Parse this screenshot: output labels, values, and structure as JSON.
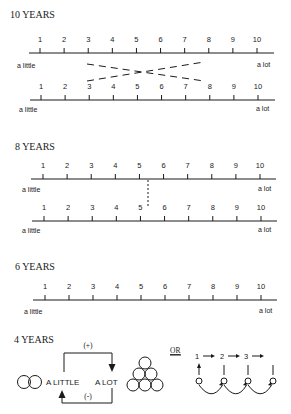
{
  "scale": {
    "numbers": [
      "1",
      "2",
      "3",
      "4",
      "5",
      "6",
      "7",
      "8",
      "9",
      "10"
    ],
    "low_label": "a little",
    "high_label": "a lot"
  },
  "sections": [
    {
      "id": "ten",
      "heading": "10 YEARS",
      "lines": 2,
      "link": "crossed-dashes"
    },
    {
      "id": "eight",
      "heading": "8 YEARS",
      "lines": 2,
      "link": "dotted-vertical"
    },
    {
      "id": "six",
      "heading": "6 YEARS",
      "lines": 1,
      "link": "none"
    },
    {
      "id": "four",
      "heading": "4 YEARS"
    }
  ],
  "four_years": {
    "heading": "4 YEARS",
    "plus_label": "(+)",
    "minus_label": "(-)",
    "little_label": "A LITTLE",
    "lot_label": "A LOT",
    "or_label": "OR",
    "count_labels": [
      "1",
      "2",
      "3"
    ]
  },
  "colors": {
    "ink": "#1a1a1a",
    "background": "#ffffff"
  }
}
